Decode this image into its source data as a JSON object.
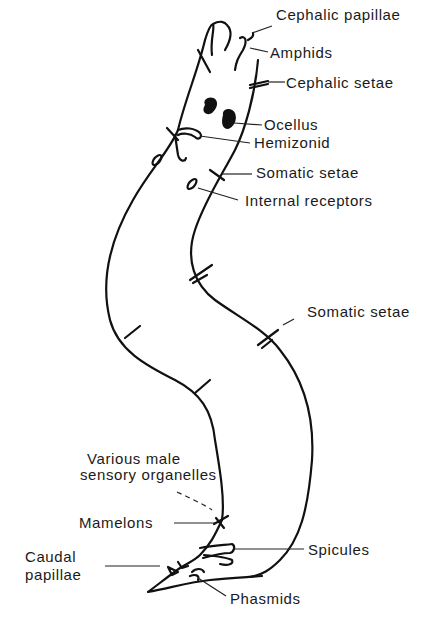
{
  "diagram": {
    "labels": {
      "cephalic_papillae": "Cephalic papillae",
      "amphids": "Amphids",
      "cephalic_setae": "Cephalic setae",
      "ocellus": "Ocellus",
      "hemizonid": "Hemizonid",
      "somatic_setae_anterior": "Somatic setae",
      "internal_receptors": "Internal receptors",
      "somatic_setae_mid": "Somatic setae",
      "male_sensory_line1": "Various male",
      "male_sensory_line2": "sensory organelles",
      "mamelons": "Mamelons",
      "spicules": "Spicules",
      "caudal_papillae_line1": "Caudal",
      "caudal_papillae_line2": "papillae",
      "phasmids": "Phasmids"
    },
    "colors": {
      "ink": "#111111",
      "background": "#ffffff"
    }
  }
}
